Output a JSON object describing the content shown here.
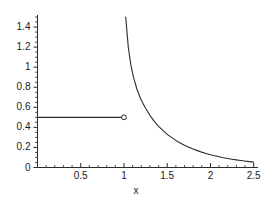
{
  "chart_data": {
    "type": "line",
    "title": "",
    "xlabel": "x",
    "ylabel": "",
    "xlim": [
      0,
      2.55
    ],
    "ylim": [
      0,
      1.52
    ],
    "grid": false,
    "legend": null,
    "x_ticks": [
      0.5,
      1,
      1.5,
      2,
      2.5
    ],
    "x_tick_labels": [
      "0.5",
      "1",
      "1.5",
      "2",
      "2.5"
    ],
    "x_minor_tick_step": 0.1,
    "y_ticks": [
      0,
      0.2,
      0.4,
      0.6,
      0.8,
      1,
      1.2,
      1.4
    ],
    "y_tick_labels": [
      "0",
      "0.2",
      "0.4",
      "0.6",
      "0.8",
      "1",
      "1.2",
      "1.4"
    ],
    "y_minor_tick_step": 0.05,
    "line_color": "#2b2b2b",
    "series": [
      {
        "name": "constant branch",
        "style": "solid",
        "x": [
          0.0,
          0.25,
          0.5,
          0.75,
          1.0
        ],
        "values": [
          0.5,
          0.5,
          0.5,
          0.5,
          0.5
        ],
        "endpoint_marker": "open-circle",
        "endpoint_x": 1.0,
        "endpoint_y": 0.5
      },
      {
        "name": "decaying branch",
        "style": "solid",
        "x": [
          1.02,
          1.05,
          1.08,
          1.11,
          1.15,
          1.2,
          1.25,
          1.3,
          1.35,
          1.4,
          1.45,
          1.5,
          1.55,
          1.6,
          1.65,
          1.7,
          1.75,
          1.8,
          1.85,
          1.9,
          1.95,
          2.0,
          2.05,
          2.1,
          2.15,
          2.2,
          2.25,
          2.3,
          2.35,
          2.4,
          2.45,
          2.5
        ],
        "values": [
          1.5,
          1.2,
          1.02,
          0.9,
          0.78,
          0.67,
          0.59,
          0.52,
          0.46,
          0.41,
          0.37,
          0.33,
          0.3,
          0.27,
          0.245,
          0.222,
          0.202,
          0.184,
          0.168,
          0.153,
          0.14,
          0.128,
          0.117,
          0.107,
          0.098,
          0.09,
          0.083,
          0.076,
          0.07,
          0.064,
          0.059,
          0.054
        ]
      }
    ]
  }
}
